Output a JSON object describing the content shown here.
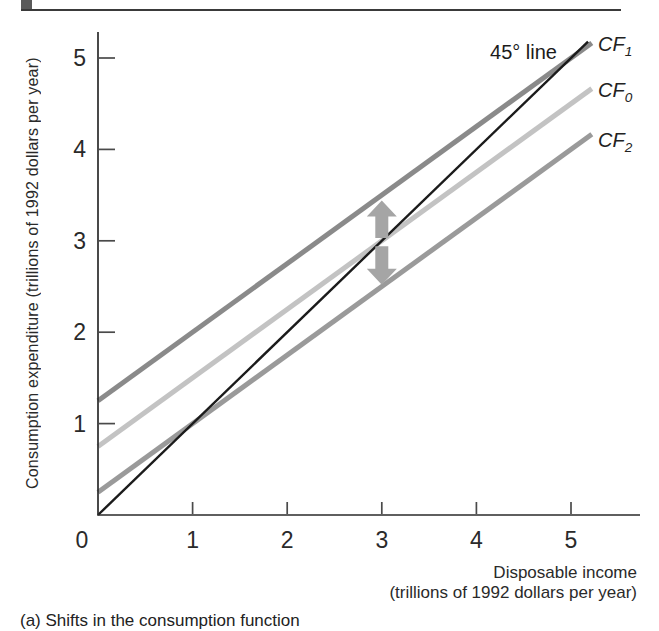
{
  "figure": {
    "caption": "(a) Shifts in the consumption function"
  },
  "chart_data": {
    "type": "line",
    "title": "",
    "ylabel": "Consumption expenditure (trillions of 1992 dollars per year)",
    "xlabel_line1": "Disposable income",
    "xlabel_line2": "(trillions of 1992 dollars per year)",
    "xlim": [
      0,
      5.7
    ],
    "ylim": [
      0,
      5.3
    ],
    "x_ticks": [
      "1",
      "2",
      "3",
      "4",
      "5"
    ],
    "y_ticks": [
      "1",
      "2",
      "3",
      "4",
      "5"
    ],
    "origin_label": "0",
    "grid": false,
    "axis_color": "#2b2b2b",
    "tick_color": "#4a4a4a",
    "series": [
      {
        "name": "CF1",
        "label": "CF",
        "sub": "1",
        "intercept": 1.25,
        "slope": 0.75,
        "x_start": 0,
        "x_end": 5.22,
        "color": "#8a8a8a",
        "width": 5
      },
      {
        "name": "CF0",
        "label": "CF",
        "sub": "0",
        "intercept": 0.75,
        "slope": 0.75,
        "x_start": 0,
        "x_end": 5.22,
        "color": "#c3c3c3",
        "width": 5
      },
      {
        "name": "CF2",
        "label": "CF",
        "sub": "2",
        "intercept": 0.25,
        "slope": 0.75,
        "x_start": 0,
        "x_end": 5.22,
        "color": "#9a9a9a",
        "width": 5
      },
      {
        "name": "45-degree-line",
        "label": "45° line",
        "sub": "",
        "intercept": 0,
        "slope": 1,
        "x_start": 0,
        "x_end": 5.18,
        "color": "#1b1b1b",
        "width": 2.4
      }
    ],
    "arrows": [
      {
        "direction": "up",
        "x": 3,
        "y_from": 3.03,
        "y_to": 3.44,
        "color": "#a5a5a5"
      },
      {
        "direction": "down",
        "x": 3,
        "y_from": 2.94,
        "y_to": 2.52,
        "color": "#a5a5a5"
      }
    ]
  }
}
